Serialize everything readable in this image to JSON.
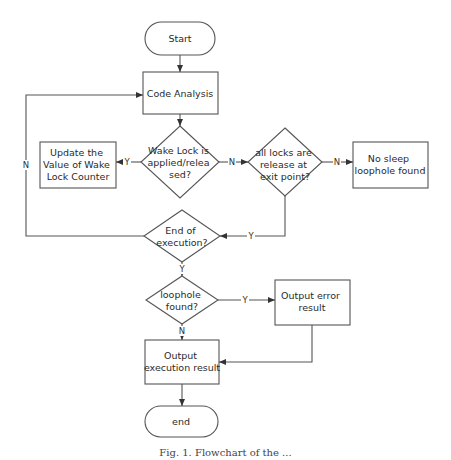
{
  "diagram": {
    "type": "flowchart",
    "nodes": {
      "start": {
        "shape": "terminator",
        "label": "Start"
      },
      "code_analysis": {
        "shape": "process",
        "label": "Code Analysis"
      },
      "wake_lock_decision": {
        "shape": "decision",
        "lines": [
          "Wake Lock is",
          "applied/relea",
          "sed?"
        ]
      },
      "update_counter": {
        "shape": "process",
        "lines": [
          "Update the",
          "Value of Wake",
          "Lock Counter"
        ]
      },
      "all_locks_decision": {
        "shape": "decision",
        "lines": [
          "all locks are",
          "release at",
          "exit point?"
        ]
      },
      "no_sleep": {
        "shape": "process",
        "lines": [
          "No sleep",
          "loophole found"
        ]
      },
      "end_exec_decision": {
        "shape": "decision",
        "lines": [
          "End of",
          "execution?"
        ]
      },
      "loophole_decision": {
        "shape": "decision",
        "lines": [
          "loophole",
          "found?"
        ]
      },
      "output_error": {
        "shape": "process",
        "lines": [
          "Output error",
          "result"
        ]
      },
      "output_exec": {
        "shape": "process",
        "lines": [
          "Output",
          "execution result"
        ]
      },
      "end": {
        "shape": "terminator",
        "label": "end"
      }
    },
    "edges": [
      {
        "from": "start",
        "to": "code_analysis",
        "label": ""
      },
      {
        "from": "code_analysis",
        "to": "wake_lock_decision",
        "label": ""
      },
      {
        "from": "wake_lock_decision",
        "to": "update_counter",
        "label": "Y"
      },
      {
        "from": "wake_lock_decision",
        "to": "all_locks_decision",
        "label": "N"
      },
      {
        "from": "all_locks_decision",
        "to": "no_sleep",
        "label": "N"
      },
      {
        "from": "all_locks_decision",
        "to": "end_exec_decision",
        "label": "Y"
      },
      {
        "from": "end_exec_decision",
        "to": "code_analysis",
        "label": "N"
      },
      {
        "from": "end_exec_decision",
        "to": "loophole_decision",
        "label": "Y"
      },
      {
        "from": "loophole_decision",
        "to": "output_error",
        "label": "Y"
      },
      {
        "from": "loophole_decision",
        "to": "output_exec",
        "label": "N"
      },
      {
        "from": "output_error",
        "to": "output_exec",
        "label": ""
      },
      {
        "from": "output_exec",
        "to": "end",
        "label": ""
      }
    ],
    "edge_labels": {
      "yes": "Y",
      "no": "N"
    },
    "colors": {
      "stroke": "#555555",
      "text": "#2a2a2a",
      "background": "#ffffff"
    }
  },
  "caption": "Fig. 1. Flowchart of the ..."
}
